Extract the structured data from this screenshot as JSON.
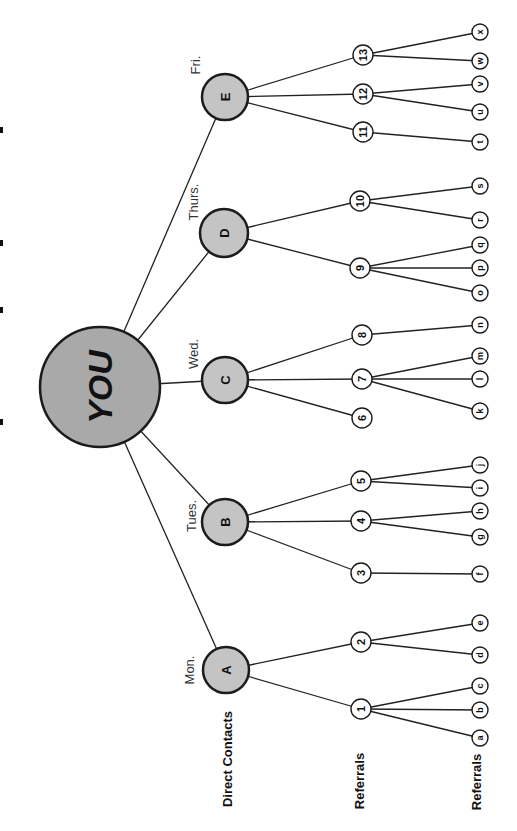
{
  "diagram": {
    "type": "referral-tree",
    "orientation": "rotated-90-ccw",
    "root": {
      "label": "YOU",
      "x": 100,
      "y": 387,
      "r": 60
    },
    "level_labels": [
      {
        "id": "direct",
        "text": "Direct Contacts",
        "x": 227,
        "y": 759
      },
      {
        "id": "ref1",
        "text": "Referrals",
        "x": 359,
        "y": 781
      },
      {
        "id": "ref2",
        "text": "Referrals",
        "x": 476,
        "y": 782
      }
    ],
    "direct_contacts": [
      {
        "label": "A",
        "day": "Mon.",
        "x": 226,
        "y": 670,
        "r": 23,
        "day_x": 189,
        "day_y": 670,
        "referrals": [
          {
            "label": "1",
            "x": 361,
            "y": 709,
            "leaves": [
              {
                "label": "c",
                "y": 686
              },
              {
                "label": "b",
                "y": 710
              },
              {
                "label": "a",
                "y": 738
              }
            ]
          },
          {
            "label": "2",
            "x": 361,
            "y": 642,
            "leaves": [
              {
                "label": "e",
                "y": 623
              },
              {
                "label": "d",
                "y": 655
              }
            ]
          }
        ]
      },
      {
        "label": "B",
        "day": "Tues.",
        "x": 225,
        "y": 522,
        "r": 23,
        "day_x": 191,
        "day_y": 516,
        "referrals": [
          {
            "label": "3",
            "x": 361,
            "y": 573,
            "leaves": [
              {
                "label": "f",
                "y": 574
              }
            ]
          },
          {
            "label": "4",
            "x": 361,
            "y": 521,
            "leaves": [
              {
                "label": "h",
                "y": 511
              },
              {
                "label": "g",
                "y": 537
              }
            ]
          },
          {
            "label": "5",
            "x": 361,
            "y": 481,
            "leaves": [
              {
                "label": "j",
                "y": 465
              },
              {
                "label": "i",
                "y": 488
              }
            ]
          }
        ]
      },
      {
        "label": "C",
        "day": "Wed.",
        "x": 225,
        "y": 380,
        "r": 23,
        "day_x": 193,
        "day_y": 354,
        "referrals": [
          {
            "label": "6",
            "x": 362,
            "y": 418,
            "leaves": []
          },
          {
            "label": "7",
            "x": 362,
            "y": 379,
            "leaves": [
              {
                "label": "m",
                "y": 356
              },
              {
                "label": "l",
                "y": 379
              },
              {
                "label": "k",
                "y": 411
              }
            ]
          },
          {
            "label": "8",
            "x": 362,
            "y": 335,
            "leaves": [
              {
                "label": "n",
                "y": 325
              }
            ]
          }
        ]
      },
      {
        "label": "D",
        "day": "Thurs.",
        "x": 224,
        "y": 233,
        "r": 24,
        "day_x": 193,
        "day_y": 202,
        "referrals": [
          {
            "label": "9",
            "x": 360,
            "y": 268,
            "leaves": [
              {
                "label": "q",
                "y": 245
              },
              {
                "label": "p",
                "y": 268
              },
              {
                "label": "o",
                "y": 293
              }
            ]
          },
          {
            "label": "10",
            "x": 360,
            "y": 201,
            "leaves": [
              {
                "label": "s",
                "y": 186
              },
              {
                "label": "r",
                "y": 220
              }
            ]
          }
        ]
      },
      {
        "label": "E",
        "day": "Fri.",
        "x": 225,
        "y": 97,
        "r": 23,
        "day_x": 195,
        "day_y": 65,
        "referrals": [
          {
            "label": "11",
            "x": 363,
            "y": 132,
            "leaves": [
              {
                "label": "t",
                "y": 142
              }
            ]
          },
          {
            "label": "12",
            "x": 363,
            "y": 94,
            "leaves": [
              {
                "label": "v",
                "y": 84
              },
              {
                "label": "u",
                "y": 112
              }
            ]
          },
          {
            "label": "13",
            "x": 363,
            "y": 55,
            "leaves": [
              {
                "label": "x",
                "y": 32
              },
              {
                "label": "w",
                "y": 61
              }
            ]
          }
        ]
      }
    ],
    "leaf_x": 480,
    "referral_radius": 10,
    "leaf_radius": 8,
    "colors": {
      "root_fill": "#a9a9a9",
      "direct_fill": "#c4c4c4",
      "referral_fill": "#ffffff",
      "stroke": "#1b1b1b"
    },
    "cut_off_title_fragments_y": [
      130,
      243,
      310,
      422
    ]
  }
}
